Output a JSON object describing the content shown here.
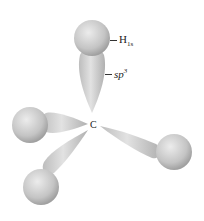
{
  "figure": {
    "type": "sp3 hybrid orbital overlap diagram (methane)",
    "center_atom": {
      "label": "C"
    },
    "labels": {
      "h_orbital": {
        "base": "H",
        "sub": "1s"
      },
      "hybrid_orbital": {
        "base": "sp",
        "sup": "3"
      }
    },
    "bonds": [
      {
        "name": "top",
        "direction": "up"
      },
      {
        "name": "left",
        "direction": "left"
      },
      {
        "name": "lower-left",
        "direction": "down-left"
      },
      {
        "name": "right",
        "direction": "down-right"
      }
    ],
    "colors": {
      "lobe_light": "#e6e6e6",
      "lobe_dark": "#a8a8a8",
      "background": "#ffffff",
      "text": "#222222"
    }
  }
}
